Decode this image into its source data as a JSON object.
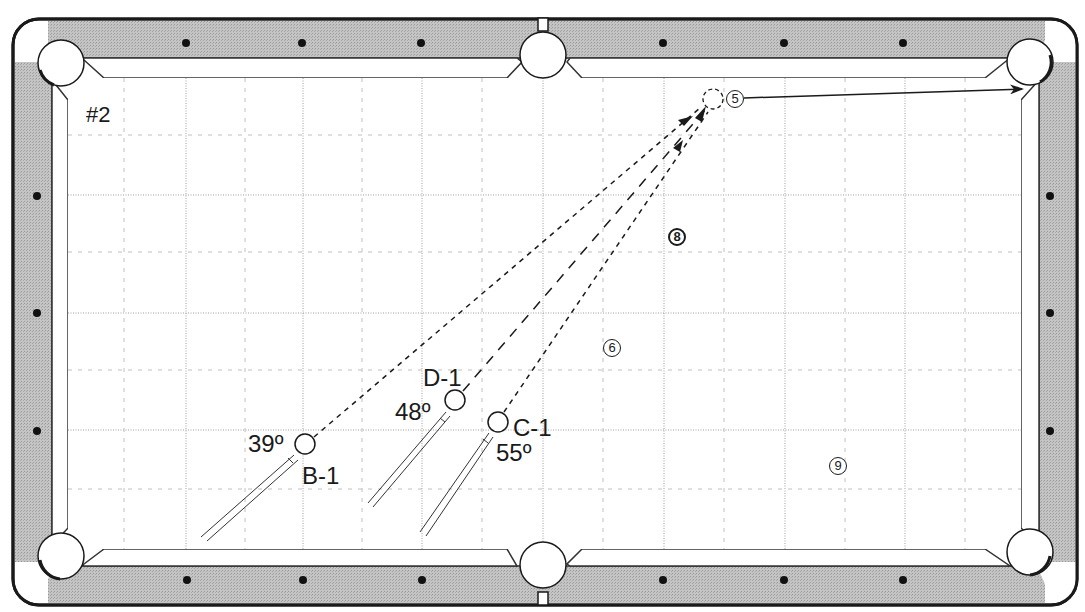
{
  "diagram": {
    "title": "#2",
    "colors": {
      "rail": "#b8b8b8",
      "outline": "#222222",
      "grid": "#9a9a9a",
      "cloth": "#ffffff"
    },
    "cue_positions": [
      {
        "id": "B-1",
        "label": "B-1",
        "angle_label": "39º"
      },
      {
        "id": "D-1",
        "label": "D-1",
        "angle_label": "48º"
      },
      {
        "id": "C-1",
        "label": "C-1",
        "angle_label": "55º"
      }
    ],
    "balls": [
      {
        "number": "5",
        "role": "object-ball"
      },
      {
        "number": "6",
        "role": "blocker"
      },
      {
        "number": "8",
        "role": "blocker"
      },
      {
        "number": "9",
        "role": "blocker"
      }
    ],
    "annotations": {
      "ghost_ball": "dashed ghost ball contact point next to ball 5",
      "object_ball_path": "ball 5 to top-right corner pocket"
    }
  }
}
